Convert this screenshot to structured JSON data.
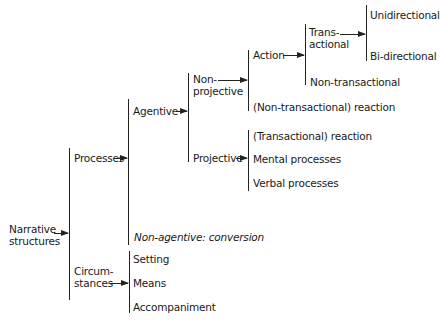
{
  "diagram": {
    "root": "Narrative structures",
    "nodes": {
      "narrative": [
        "Narrative",
        "structures"
      ],
      "processes": "Processes",
      "circumstances": [
        "Circum-",
        "stances"
      ],
      "setting": "Setting",
      "means": "Means",
      "accompaniment": "Accompaniment",
      "agentive": "Agentive",
      "non_agentive": "Non-agentive: conversion",
      "non_projective": [
        "Non-",
        "projective"
      ],
      "projective": "Projective",
      "transactional_reaction": "(Transactional) reaction",
      "mental_processes": "Mental processes",
      "verbal_processes": "Verbal processes",
      "action": "Action",
      "non_transactional_reaction": "(Non-transactional) reaction",
      "transactional": [
        "Trans-",
        "actional"
      ],
      "non_transactional": "Non-transactional",
      "unidirectional": "Unidirectional",
      "bi_directional": "Bi-directional"
    },
    "tree": {
      "Narrative structures": {
        "Processes": {
          "Agentive": {
            "Non-projective": {
              "Action": {
                "Transactional": [
                  "Unidirectional",
                  "Bi-directional"
                ],
                "Non-transactional": []
              },
              "(Non-transactional) reaction": []
            },
            "Projective": [
              "(Transactional) reaction",
              "Mental processes",
              "Verbal processes"
            ]
          },
          "Non-agentive: conversion": []
        },
        "Circumstances": [
          "Setting",
          "Means",
          "Accompaniment"
        ]
      }
    }
  }
}
